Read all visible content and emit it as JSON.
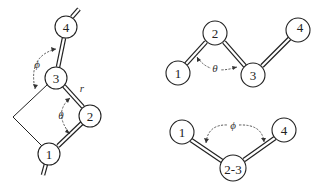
{
  "figure": {
    "panel_left": {
      "description": "Four-atom chain with torsion and bond angles",
      "atoms": [
        {
          "id": "1",
          "label": "1",
          "cx": 49,
          "cy": 154,
          "r": 11
        },
        {
          "id": "2",
          "label": "2",
          "cx": 90,
          "cy": 116,
          "r": 11
        },
        {
          "id": "3",
          "label": "3",
          "cx": 56,
          "cy": 78,
          "r": 11
        },
        {
          "id": "4",
          "label": "4",
          "cx": 66,
          "cy": 27,
          "r": 11
        }
      ],
      "bonds": [
        [
          "1",
          "2"
        ],
        [
          "2",
          "3"
        ],
        [
          "3",
          "4"
        ]
      ],
      "labels": {
        "phi": "ϕ",
        "theta": "θ",
        "r": "r"
      }
    },
    "panel_top_right": {
      "description": "Bond angle view",
      "atoms": [
        {
          "id": "1",
          "label": "1",
          "cx": 178,
          "cy": 73,
          "r": 12
        },
        {
          "id": "2",
          "label": "2",
          "cx": 215,
          "cy": 33,
          "r": 12
        },
        {
          "id": "3",
          "label": "3",
          "cx": 253,
          "cy": 75,
          "r": 12
        },
        {
          "id": "4",
          "label": "4",
          "cx": 298,
          "cy": 30,
          "r": 12
        }
      ],
      "labels": {
        "theta": "θ"
      }
    },
    "panel_bottom_right": {
      "description": "Newman-like projection along 2-3 bond",
      "atoms": [
        {
          "id": "1",
          "label": "1",
          "cx": 182,
          "cy": 132,
          "r": 12
        },
        {
          "id": "23",
          "label": "2-3",
          "cx": 233,
          "cy": 168,
          "r": 13
        },
        {
          "id": "4",
          "label": "4",
          "cx": 284,
          "cy": 130,
          "r": 12
        }
      ],
      "labels": {
        "phi": "ϕ"
      }
    }
  }
}
